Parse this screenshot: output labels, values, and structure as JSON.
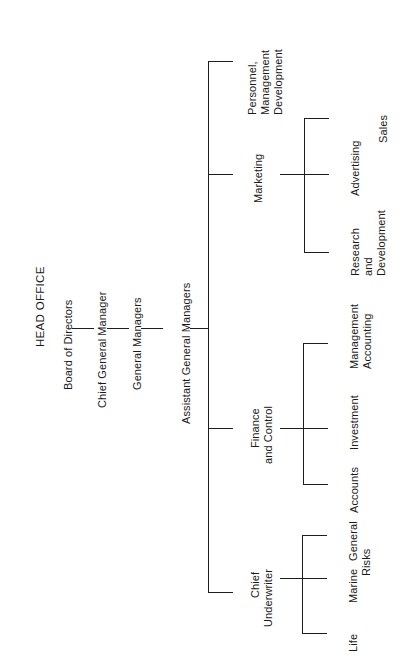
{
  "chart": {
    "title": "HEAD OFFICE",
    "type": "organization-chart",
    "orientation": "rotated-90-ccw"
  },
  "hierarchy": {
    "levels": [
      {
        "label": "Board of Directors"
      },
      {
        "label": "Chief General Manager"
      },
      {
        "label": "General Managers"
      },
      {
        "label": "Assistant General Managers"
      }
    ],
    "divisions": [
      {
        "label_lines": [
          "Personnel,",
          "Management",
          "Development"
        ],
        "line1": "Personnel,",
        "line2": "Management",
        "line3": "Development",
        "children": []
      },
      {
        "label_lines": [
          "Marketing"
        ],
        "line1": "Marketing",
        "children": [
          {
            "line1": "Sales"
          },
          {
            "line1": "Advertising"
          },
          {
            "line1": "Research",
            "line2": "and",
            "line3": "Development"
          }
        ]
      },
      {
        "label_lines": [
          "Finance",
          "and Control"
        ],
        "line1": "Finance",
        "line2": "and Control",
        "children": [
          {
            "line1": "Management",
            "line2": "Accounting"
          },
          {
            "line1": "Investment"
          },
          {
            "line1": "Accounts"
          }
        ]
      },
      {
        "label_lines": [
          "Chief",
          "Underwriter"
        ],
        "line1": "Chief",
        "line2": "Underwriter",
        "children": [
          {
            "line1": "General",
            "line2": "Risks"
          },
          {
            "line1": "Marine"
          },
          {
            "line1": "Life"
          }
        ]
      }
    ]
  },
  "colors": {
    "line": "#1d1d1d",
    "text": "#1a1a1a",
    "background": "#ffffff"
  }
}
